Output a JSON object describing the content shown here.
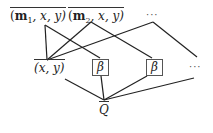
{
  "top_nodes": [
    {
      "id": "m1",
      "prefix": "(",
      "bold": "m",
      "sub": "1",
      "rest": ", x, y)"
    },
    {
      "id": "m2",
      "prefix": "(",
      "bold": "m",
      "sub": "2",
      "rest": ", x, y)"
    },
    {
      "id": "top_ellipsis",
      "text": "···"
    }
  ],
  "middle_nodes": [
    {
      "id": "xy",
      "text": "(x, y)"
    },
    {
      "id": "beta1",
      "text": "β"
    },
    {
      "id": "beta2",
      "text": "β"
    },
    {
      "id": "mid_ellipsis",
      "text": "···"
    }
  ],
  "bottom_node": {
    "id": "Q",
    "text": "Q"
  },
  "edges": [
    [
      "m1",
      "xy"
    ],
    [
      "m1",
      "beta1"
    ],
    [
      "m2",
      "xy"
    ],
    [
      "m2",
      "beta2"
    ],
    [
      "top_ellipsis",
      "xy"
    ],
    [
      "top_ellipsis",
      "mid_ellipsis"
    ],
    [
      "xy",
      "Q"
    ],
    [
      "beta1",
      "Q"
    ],
    [
      "beta2",
      "Q"
    ],
    [
      "mid_ellipsis",
      "Q"
    ]
  ]
}
